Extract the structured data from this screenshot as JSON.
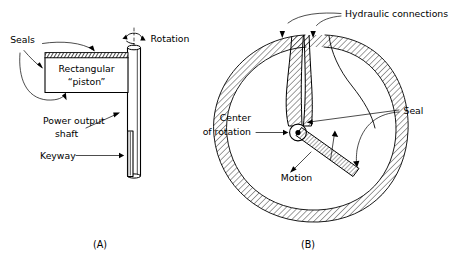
{
  "figure": {
    "background_color": "#ffffff",
    "ink_color": "#000000",
    "panels": [
      {
        "id": "A",
        "caption": "(A)",
        "description": "Rectangular piston rotary actuator with power output shaft",
        "labels": [
          {
            "name": "seals",
            "text": "Seals"
          },
          {
            "name": "rotation",
            "text": "Rotation"
          },
          {
            "name": "piston-line-1",
            "text": "Rectangular"
          },
          {
            "name": "piston-line-2",
            "text": "“piston”"
          },
          {
            "name": "power-output-line-1",
            "text": "Power output"
          },
          {
            "name": "power-output-line-2",
            "text": "shaft"
          },
          {
            "name": "keyway",
            "text": "Keyway"
          }
        ]
      },
      {
        "id": "B",
        "caption": "(B)",
        "description": "Sectional view of vane-type rotary actuator housing with hydraulic ports",
        "labels": [
          {
            "name": "hydraulic-connections",
            "text": "Hydraulic connections"
          },
          {
            "name": "center-of-rotation-line-1",
            "text": "Center"
          },
          {
            "name": "center-of-rotation-line-2",
            "text": "of rotation"
          },
          {
            "name": "seal",
            "text": "Seal"
          },
          {
            "name": "motion",
            "text": "Motion"
          }
        ]
      }
    ]
  }
}
